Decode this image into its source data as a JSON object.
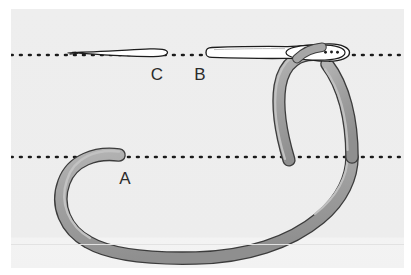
{
  "figure": {
    "kind": "line-illustration",
    "width": 411,
    "height": 275,
    "labels": [
      {
        "id": "A",
        "text": "A",
        "x": 118,
        "y": 184,
        "refers_to": "free-thread-end"
      },
      {
        "id": "B",
        "text": "B",
        "x": 200,
        "y": 80,
        "refers_to": "needle-body-shaft"
      },
      {
        "id": "C",
        "text": "C",
        "x": 157,
        "y": 80,
        "refers_to": "needle-point"
      }
    ],
    "guides": [
      {
        "id": "tissue-line-upper",
        "y": 55,
        "style": "dotted"
      },
      {
        "id": "tissue-line-lower",
        "y": 157,
        "style": "dotted"
      }
    ],
    "colors": {
      "page_background": "#ffffff",
      "panel_background": "#eeeeee",
      "panel_background_lower_band": "#f2f2f2",
      "thread_fill": "#9d9d9d",
      "thread_fill_light": "#b5b5b5",
      "thread_outline": "#3c3c3c",
      "needle_fill": "#ffffff",
      "needle_outline": "#1d1d1d",
      "dotted_guide": "#1a1a1a",
      "label": "#2b2b2b"
    },
    "parts": [
      {
        "id": "needle-point",
        "label": "C",
        "description": "tapered sharp needle point, left segment"
      },
      {
        "id": "needle-body-shaft",
        "label": "B",
        "description": "straight needle shaft with swaged eye at right"
      },
      {
        "id": "needle-eye",
        "description": "eye / swage at right end of needle holding the thread"
      },
      {
        "id": "thread-loop-small",
        "description": "thread loop passing through the needle eye"
      },
      {
        "id": "thread-free-end",
        "label": "A",
        "description": "rounded free end of thread resting on lower guide line"
      },
      {
        "id": "thread-loop-large",
        "description": "large sweeping thread loop below the guide lines"
      }
    ]
  }
}
